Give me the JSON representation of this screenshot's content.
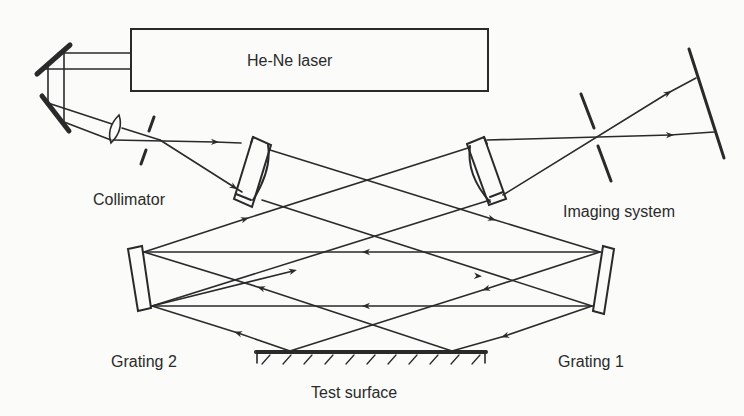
{
  "diagram": {
    "type": "optical-setup",
    "colors": {
      "background": "#fbfbfa",
      "stroke": "#2a2a2a"
    },
    "labels": {
      "laser": "He-Ne laser",
      "collimator": "Collimator",
      "imaging_system": "Imaging system",
      "grating_1": "Grating 1",
      "grating_2": "Grating 2",
      "test_surface": "Test surface"
    },
    "components": [
      {
        "id": "laser",
        "kind": "light-source",
        "label": "He-Ne laser"
      },
      {
        "id": "fold-mirror-upper",
        "kind": "mirror"
      },
      {
        "id": "fold-mirror-lower",
        "kind": "mirror"
      },
      {
        "id": "collimator-lens",
        "kind": "lens",
        "label": "Collimator"
      },
      {
        "id": "collimator-aperture",
        "kind": "aperture"
      },
      {
        "id": "meniscus-lens-left",
        "kind": "lens"
      },
      {
        "id": "meniscus-lens-right",
        "kind": "lens"
      },
      {
        "id": "imaging-aperture",
        "kind": "aperture"
      },
      {
        "id": "imaging-screen",
        "kind": "screen",
        "label": "Imaging system"
      },
      {
        "id": "grating-1",
        "kind": "grating",
        "label": "Grating 1"
      },
      {
        "id": "grating-2",
        "kind": "grating",
        "label": "Grating 2"
      },
      {
        "id": "test-surface",
        "kind": "surface",
        "label": "Test surface"
      }
    ]
  }
}
